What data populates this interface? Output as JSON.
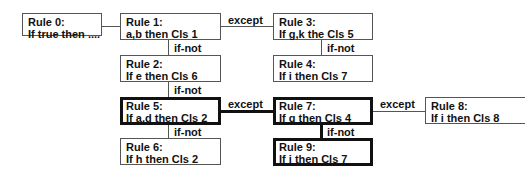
{
  "rules": {
    "r0": {
      "title": "Rule 0:",
      "body": "If true then ...."
    },
    "r1": {
      "title": "Rule 1:",
      "body": "a,b then Cls 1"
    },
    "r2": {
      "title": "Rule 2:",
      "body": "If e then Cls 6"
    },
    "r3": {
      "title": "Rule 3:",
      "body": "If g,k the Cls 5"
    },
    "r4": {
      "title": "Rule 4:",
      "body": "If i then Cls 7"
    },
    "r5": {
      "title": "Rule 5:",
      "body": "If a,d then Cls 2"
    },
    "r6": {
      "title": "Rule 6:",
      "body": "If h then Cls 2"
    },
    "r7": {
      "title": "Rule 7:",
      "body": "If g then Cls 4"
    },
    "r8": {
      "title": "Rule 8:",
      "body": "If i then Cls 8"
    },
    "r9": {
      "title": "Rule 9:",
      "body": "If i then Cls 7"
    }
  },
  "edges": {
    "r1_r3": "except",
    "r1_r2": "if-not",
    "r3_r4": "if-not",
    "r2_r5": "if-not",
    "r5_r7": "except",
    "r7_r8": "except",
    "r5_r6": "if-not",
    "r7_r9": "if-not"
  }
}
